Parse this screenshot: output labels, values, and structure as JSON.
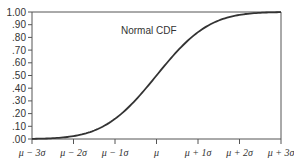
{
  "chart_data": {
    "type": "line",
    "title": "",
    "xlabel": "",
    "ylabel": "",
    "annotation": "Normal CDF",
    "x_tick_labels": [
      "μ − 3σ",
      "μ − 2σ",
      "μ − 1σ",
      "μ",
      "μ + 1σ",
      "μ + 2σ",
      "μ + 3σ"
    ],
    "x_tick_values": [
      -3,
      -2,
      -1,
      0,
      1,
      2,
      3
    ],
    "y_tick_labels": [
      "1.00",
      ".90",
      ".80",
      ".70",
      ".60",
      ".50",
      ".40",
      ".30",
      ".20",
      ".10",
      ".00"
    ],
    "ylim": [
      0,
      1
    ],
    "xlim": [
      -3,
      3
    ],
    "grid": false,
    "series": [
      {
        "name": "Normal CDF",
        "x": [
          -3,
          -2.5,
          -2,
          -1.5,
          -1,
          -0.5,
          0,
          0.5,
          1,
          1.5,
          2,
          2.5,
          3
        ],
        "values": [
          0.0013,
          0.0062,
          0.0228,
          0.0668,
          0.1587,
          0.3085,
          0.5,
          0.6915,
          0.8413,
          0.9332,
          0.9772,
          0.9938,
          0.9987
        ]
      }
    ],
    "colors": {
      "line": "#333333",
      "axis": "#555555"
    }
  }
}
